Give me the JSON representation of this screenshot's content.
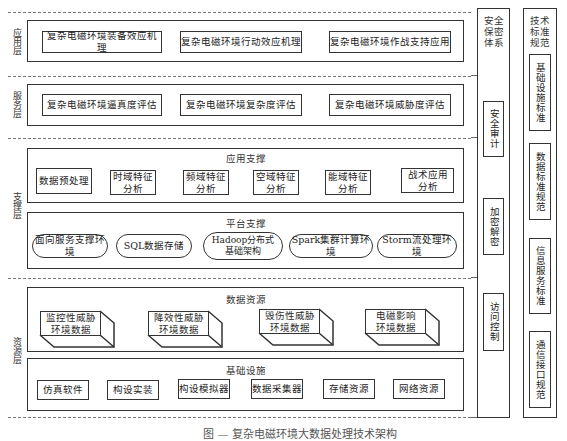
{
  "diagram": {
    "layers": {
      "application": {
        "label": "应用层",
        "items": [
          "复杂电磁环境装备效应机理",
          "复杂电磁环境行动效应机理",
          "复杂电磁环境作战支持应用"
        ]
      },
      "service": {
        "label": "服务层",
        "items": [
          "复杂电磁环境逼真度评估",
          "复杂电磁环境复杂度评估",
          "复杂电磁环境威胁度评估"
        ]
      },
      "support": {
        "label": "支撑层",
        "app_support": {
          "title": "应用支撑",
          "items": [
            "数据预处理",
            "时域特征\n分析",
            "频域特征\n分析",
            "空域特征\n分析",
            "能域特征\n分析",
            "战术应用\n分析"
          ]
        },
        "platform_support": {
          "title": "平台支撑",
          "items": [
            "面向服务支撑环境",
            "SQL数据存储",
            "Hadoop分布式\n基础架构",
            "Spark集群计算环境",
            "Storm流处理环境"
          ]
        }
      },
      "resource": {
        "label": "资源层",
        "data_resources": {
          "title": "数据资源",
          "items": [
            "监控性威胁\n环境数据",
            "降效性威胁\n环境数据",
            "毁伤性威胁\n环境数据",
            "电磁影响\n环境数据"
          ]
        },
        "infrastructure": {
          "title": "基础设施",
          "items": [
            "仿真软件",
            "构设实装",
            "构设模拟器",
            "数据采集器",
            "存储资源",
            "网络资源"
          ]
        }
      }
    },
    "security_system": {
      "title": "安全\n保密\n体系",
      "items": [
        "安全审计",
        "加密解密",
        "访问控制"
      ]
    },
    "technical_standards": {
      "title": "技术\n标准\n规范",
      "items": [
        "基础设施标准",
        "数据标准规范",
        "信息服务标准",
        "通信接口规范"
      ]
    },
    "caption": "图 — 复杂电磁环境大数据处理技术架构"
  }
}
